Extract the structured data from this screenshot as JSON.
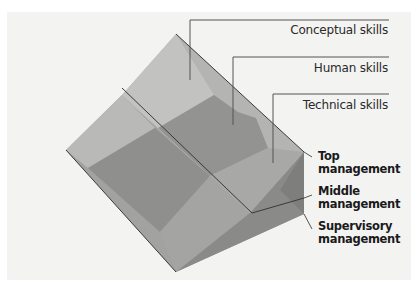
{
  "diagram": {
    "type": "management-skills-by-level",
    "skills": [
      {
        "label": "Conceptual skills"
      },
      {
        "label": "Human skills"
      },
      {
        "label": "Technical skills"
      }
    ],
    "levels": [
      {
        "line1": "Top",
        "line2": "management"
      },
      {
        "line1": "Middle",
        "line2": "management"
      },
      {
        "line1": "Supervisory",
        "line2": "management"
      }
    ],
    "colors": {
      "background": "#f3f3f2",
      "conceptual_face": "#bcbcbb",
      "human_face": "#9a9a99",
      "technical_face": "#adadac",
      "side_dark": "#8c8c8b",
      "leader_lines": "#555555"
    }
  }
}
